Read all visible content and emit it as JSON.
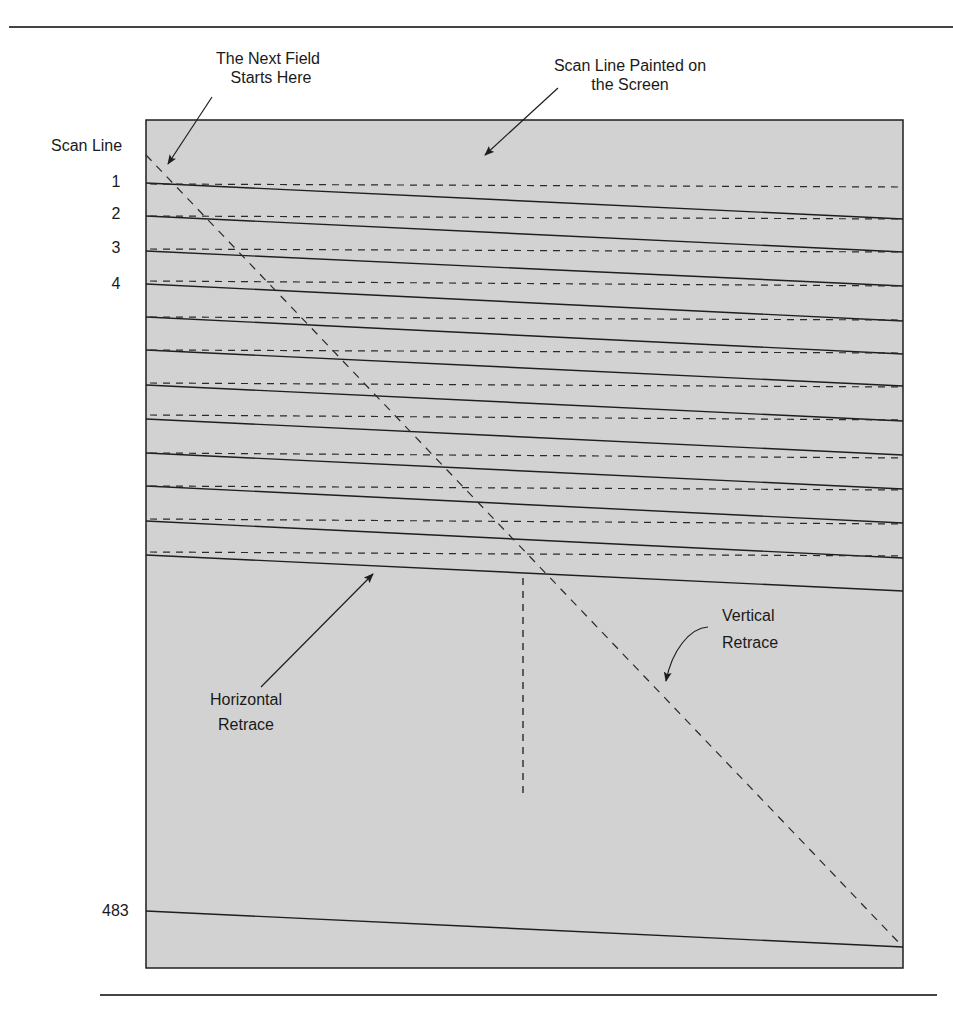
{
  "figure": {
    "annotations": {
      "next_field": [
        "The Next Field",
        "Starts Here"
      ],
      "scan_line_painted": [
        "Scan Line Painted on",
        "the Screen"
      ],
      "horizontal_retrace": [
        "Horizontal",
        "Retrace"
      ],
      "vertical_retrace": [
        "Vertical",
        "Retrace"
      ]
    },
    "axis_label": "Scan Line",
    "scan_line_numbers": [
      "1",
      "2",
      "3",
      "4"
    ],
    "last_scan_line_number": "483",
    "colors": {
      "screen_fill": "#d2d2d2",
      "line": "#1e1e1e",
      "rule": "#444444",
      "background": "#ffffff"
    },
    "scan_lines_drawn": 13,
    "retrace_lines_drawn": 12
  }
}
